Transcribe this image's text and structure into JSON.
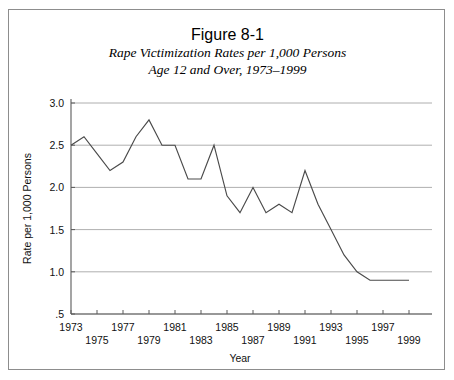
{
  "figure": {
    "number_label": "Figure 8-1",
    "subtitle_line1": "Rape Victimization Rates per 1,000 Persons",
    "subtitle_line2": "Age 12 and Over, 1973–1999"
  },
  "chart_data": {
    "type": "line",
    "title": "Rape Victimization Rates per 1,000 Persons Age 12 and Over, 1973–1999",
    "xlabel": "Year",
    "ylabel": "Rate per 1,000 Persons",
    "xlim": [
      1973,
      1999
    ],
    "ylim": [
      0.5,
      3.0
    ],
    "grid": true,
    "legend": "none",
    "ytick_labels": [
      "3.0",
      "2.5",
      "2.0",
      "1.5",
      "1.0",
      ".5"
    ],
    "ytick_values": [
      3.0,
      2.5,
      2.0,
      1.5,
      1.0,
      0.5
    ],
    "xtick_values": [
      1973,
      1975,
      1977,
      1979,
      1981,
      1983,
      1985,
      1987,
      1989,
      1991,
      1993,
      1995,
      1997,
      1999
    ],
    "xtick_labels_upper_row": [
      "1973",
      "1977",
      "1981",
      "1985",
      "1989",
      "1993",
      "1997"
    ],
    "xtick_labels_lower_row": [
      "1975",
      "1979",
      "1983",
      "1987",
      "1991",
      "1995",
      "1999"
    ],
    "x": [
      1973,
      1974,
      1975,
      1976,
      1977,
      1978,
      1979,
      1980,
      1981,
      1982,
      1983,
      1984,
      1985,
      1986,
      1987,
      1988,
      1989,
      1990,
      1991,
      1992,
      1993,
      1994,
      1995,
      1996,
      1997,
      1998,
      1999
    ],
    "values": [
      2.5,
      2.6,
      2.4,
      2.2,
      2.3,
      2.6,
      2.8,
      2.5,
      2.5,
      2.1,
      2.1,
      2.5,
      1.9,
      1.7,
      2.0,
      1.7,
      1.8,
      1.7,
      2.2,
      1.8,
      1.5,
      1.2,
      1.0,
      0.9,
      0.9,
      0.9,
      0.9
    ],
    "series": [
      {
        "name": "Rape victimization rate",
        "values": [
          2.5,
          2.6,
          2.4,
          2.2,
          2.3,
          2.6,
          2.8,
          2.5,
          2.5,
          2.1,
          2.1,
          2.5,
          1.9,
          1.7,
          2.0,
          1.7,
          1.8,
          1.7,
          2.2,
          1.8,
          1.5,
          1.2,
          1.0,
          0.9,
          0.9,
          0.9,
          0.9
        ],
        "color": "#4a4a4a"
      }
    ]
  },
  "colors": {
    "line": "#4a4a4a",
    "grid": "#9a9a9a",
    "axis": "#5a5a5a",
    "frame": "#8d8d8d",
    "text": "#111111",
    "background": "#ffffff"
  }
}
